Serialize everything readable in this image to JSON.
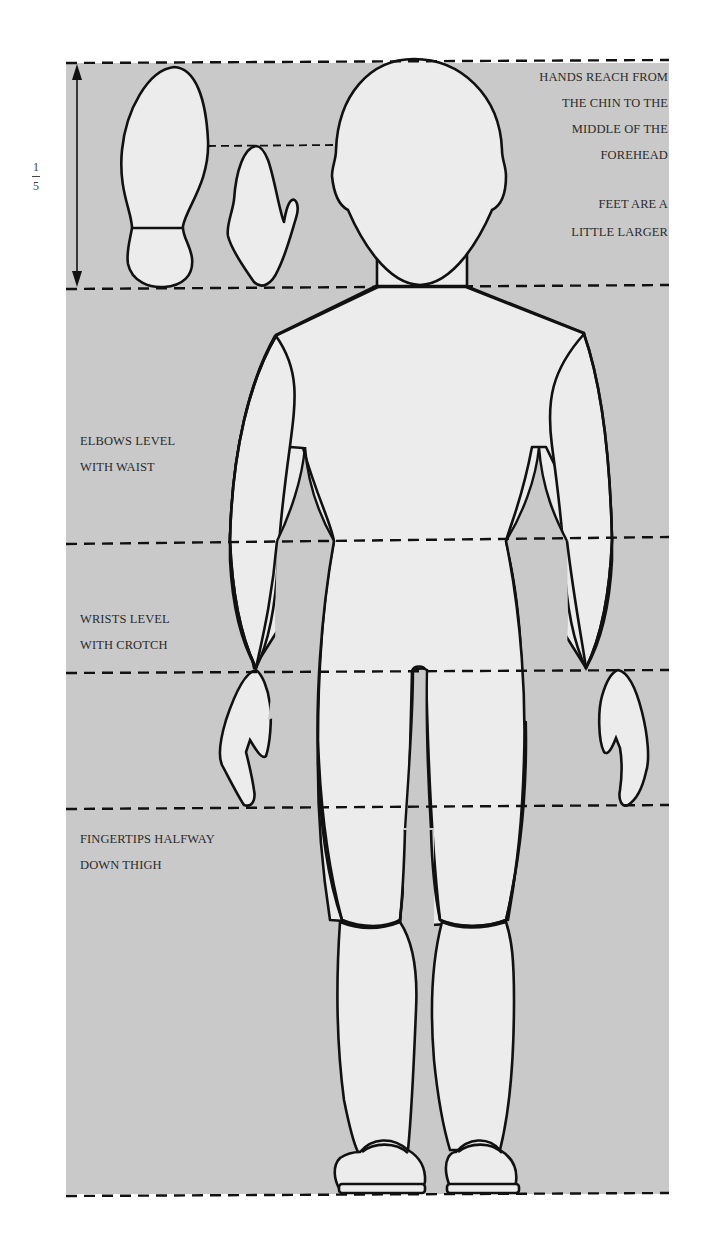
{
  "diagram": {
    "colors": {
      "panel": "#c9c9c9",
      "figure_fill": "#ececec",
      "outline": "#111111",
      "text": "#2b2b2b",
      "background": "#ffffff"
    },
    "scale_label": {
      "numerator": "1",
      "denominator": "5"
    },
    "notes": {
      "hands": [
        "HANDS REACH FROM",
        "THE CHIN TO THE",
        "MIDDLE OF THE",
        "FOREHEAD"
      ],
      "feet": [
        "FEET ARE A",
        "LITTLE LARGER"
      ],
      "elbows": [
        "ELBOWS LEVEL",
        "WITH WAIST"
      ],
      "wrists": [
        "WRISTS LEVEL",
        "WITH CROTCH"
      ],
      "fingertips": [
        "FINGERTIPS HALFWAY",
        "DOWN THIGH"
      ]
    },
    "guide_lines_y": [
      63,
      287,
      541,
      669,
      805,
      1194
    ],
    "parts": [
      "sole",
      "hand",
      "head",
      "torso",
      "left-arm",
      "right-arm",
      "left-leg",
      "right-leg",
      "left-shoe",
      "right-shoe"
    ]
  }
}
